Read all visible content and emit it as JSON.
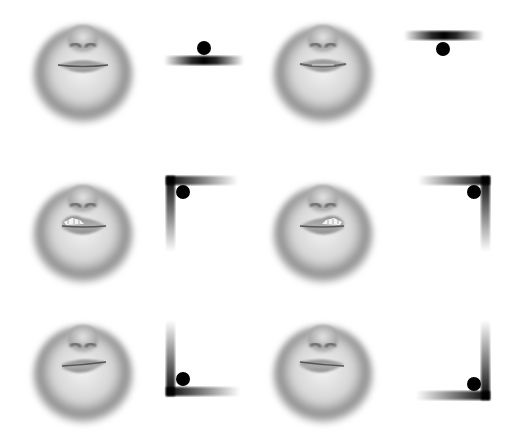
{
  "figure": {
    "rows": [
      {
        "panels": [
          {
            "expression": "neutral-closed",
            "control_type": "horizontal-bar",
            "handle_position": "top-center",
            "teeth_visible": false,
            "lip_asymmetry": "none"
          },
          {
            "expression": "neutral-parted",
            "control_type": "horizontal-bar",
            "handle_position": "bottom-center",
            "teeth_visible": false,
            "lip_asymmetry": "none"
          }
        ]
      },
      {
        "panels": [
          {
            "expression": "sneer-left",
            "control_type": "corner-bracket",
            "handle_position": "top-left",
            "teeth_visible": true,
            "lip_asymmetry": "left-raised"
          },
          {
            "expression": "sneer-right",
            "control_type": "corner-bracket",
            "handle_position": "top-right",
            "teeth_visible": true,
            "lip_asymmetry": "right-raised"
          }
        ]
      },
      {
        "panels": [
          {
            "expression": "frown-left",
            "control_type": "corner-bracket",
            "handle_position": "bottom-left",
            "teeth_visible": false,
            "lip_asymmetry": "left-lowered"
          },
          {
            "expression": "frown-right",
            "control_type": "corner-bracket",
            "handle_position": "bottom-right",
            "teeth_visible": false,
            "lip_asymmetry": "right-lowered"
          }
        ]
      }
    ],
    "colors": {
      "handle": "#000000",
      "bar": "#111111",
      "skin_light": "#efefef",
      "skin_dark": "#5a5a5a",
      "lip": "#9a9a9a",
      "background": "#ffffff"
    }
  }
}
